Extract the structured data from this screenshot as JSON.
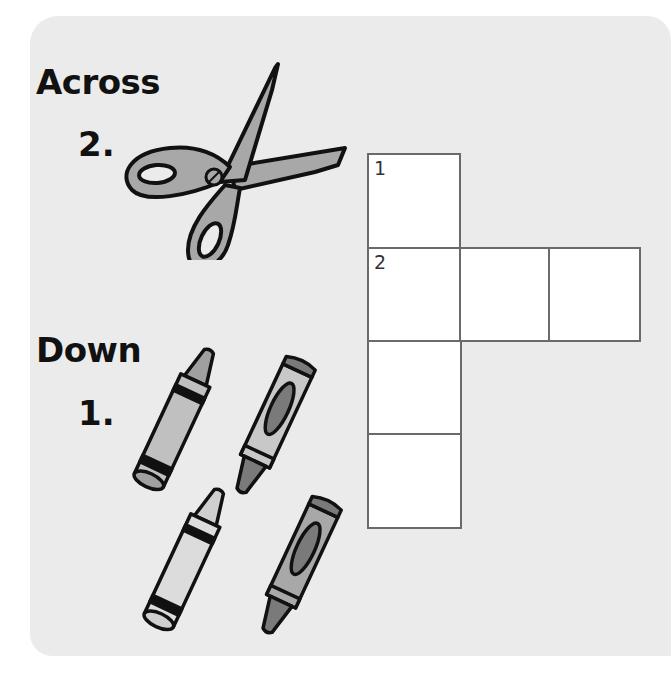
{
  "sections": {
    "across": {
      "heading": "Across",
      "clues": [
        {
          "number": "2.",
          "picture": "scissors"
        }
      ]
    },
    "down": {
      "heading": "Down",
      "clues": [
        {
          "number": "1.",
          "picture": "crayons"
        }
      ]
    }
  },
  "grid": {
    "cells": [
      {
        "row": 0,
        "col": 0,
        "number": "1"
      },
      {
        "row": 1,
        "col": 0,
        "number": "2"
      },
      {
        "row": 1,
        "col": 1,
        "number": ""
      },
      {
        "row": 1,
        "col": 2,
        "number": ""
      },
      {
        "row": 2,
        "col": 0,
        "number": ""
      },
      {
        "row": 3,
        "col": 0,
        "number": ""
      }
    ]
  },
  "colors": {
    "page": "#ebebeb",
    "cell_border": "#6a6a6a",
    "ink": "#111111",
    "scissors_fill": "#a8a8a8",
    "crayon_light": "#c8c8c8",
    "crayon_mid": "#a0a0a0",
    "crayon_dark": "#7a7a7a"
  }
}
